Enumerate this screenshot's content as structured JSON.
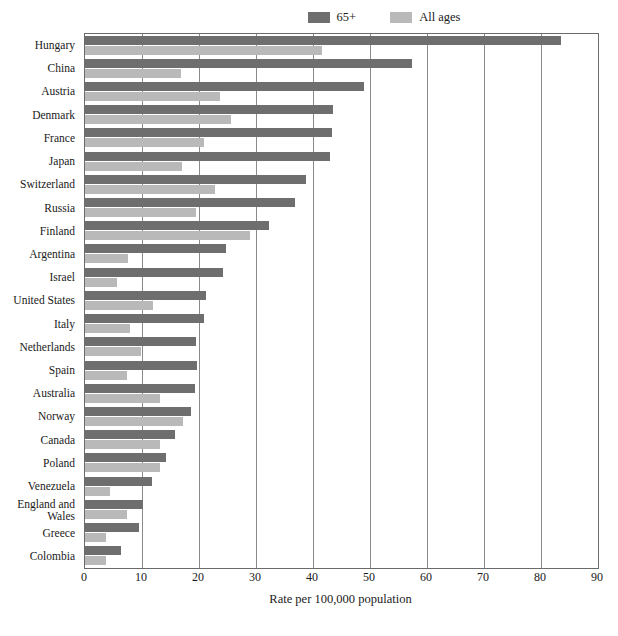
{
  "chart_data": {
    "type": "bar",
    "orientation": "horizontal",
    "title": "",
    "xlabel": "Rate per 100,000 population",
    "ylabel": "",
    "xlim": [
      0,
      90
    ],
    "xticks": [
      0,
      10,
      20,
      30,
      40,
      50,
      60,
      70,
      80,
      90
    ],
    "grid": true,
    "legend_position": "top-right",
    "categories": [
      "Hungary",
      "China",
      "Austria",
      "Denmark",
      "France",
      "Japan",
      "Switzerland",
      "Russia",
      "Finland",
      "Argentina",
      "Israel",
      "United States",
      "Italy",
      "Netherlands",
      "Spain",
      "Australia",
      "Norway",
      "Canada",
      "Poland",
      "Venezuela",
      "England and Wales",
      "Greece",
      "Colombia"
    ],
    "series": [
      {
        "name": "65+",
        "color": "#6e6e6e",
        "values": [
          83.5,
          57.4,
          48.9,
          43.5,
          43.4,
          42.9,
          38.8,
          36.9,
          32.2,
          24.8,
          24.2,
          21.3,
          20.9,
          19.4,
          19.7,
          19.3,
          18.6,
          15.8,
          14.2,
          11.8,
          10.2,
          9.4,
          6.4
        ]
      },
      {
        "name": "All ages",
        "color": "#b9b9b9",
        "values": [
          41.6,
          16.9,
          23.7,
          25.7,
          20.8,
          17.1,
          22.8,
          19.4,
          28.9,
          7.6,
          5.6,
          11.9,
          7.9,
          9.9,
          7.4,
          13.2,
          17.2,
          13.2,
          13.2,
          4.4,
          7.4,
          3.7,
          3.6
        ]
      }
    ]
  },
  "legend": {
    "items": [
      {
        "label": "65+",
        "color": "#6e6e6e"
      },
      {
        "label": "All ages",
        "color": "#b9b9b9"
      }
    ]
  },
  "axis": {
    "x_title": "Rate per 100,000 population",
    "tick_labels": [
      "0",
      "10",
      "20",
      "30",
      "40",
      "50",
      "60",
      "70",
      "80",
      "90"
    ]
  },
  "colors": {
    "bar_65plus": "#6e6e6e",
    "bar_all_ages": "#b9b9b9",
    "frame": "#6b6b6b",
    "gridline": "#8a8a8a",
    "text": "#1a1a1a",
    "background": "#ffffff"
  }
}
